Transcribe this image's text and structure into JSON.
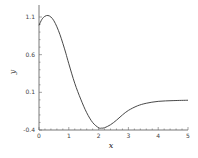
{
  "chart_data": {
    "type": "line",
    "title": "",
    "xlabel": "x",
    "ylabel": "y",
    "xlim": [
      0,
      5
    ],
    "ylim": [
      -0.4,
      1.15
    ],
    "x_ticks": [
      "0",
      "1",
      "2",
      "3",
      "4",
      "5"
    ],
    "y_ticks": [
      "-0.4",
      "0.1",
      "0.6",
      "1.1"
    ],
    "grid": false,
    "legend": null,
    "series": [
      {
        "name": "y",
        "x": [
          0,
          0.1,
          0.2,
          0.3,
          0.4,
          0.5,
          0.6,
          0.7,
          0.8,
          0.9,
          1.0,
          1.2,
          1.4,
          1.6,
          1.8,
          2.0,
          2.1,
          2.2,
          2.4,
          2.6,
          2.8,
          3.0,
          3.3,
          3.6,
          4.0,
          4.5,
          5.0
        ],
        "values": [
          0.99,
          1.07,
          1.11,
          1.12,
          1.1,
          1.05,
          0.97,
          0.87,
          0.75,
          0.62,
          0.48,
          0.22,
          0.01,
          -0.17,
          -0.3,
          -0.37,
          -0.375,
          -0.37,
          -0.33,
          -0.27,
          -0.2,
          -0.14,
          -0.08,
          -0.045,
          -0.02,
          -0.01,
          -0.005
        ]
      }
    ],
    "color": "#333333"
  }
}
